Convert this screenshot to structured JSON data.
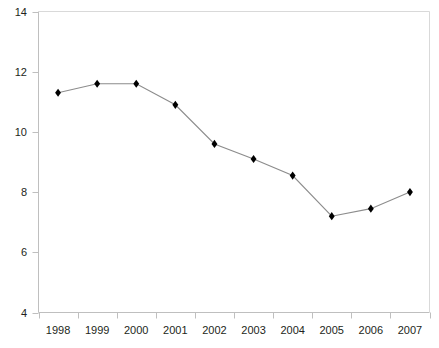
{
  "chart_data": {
    "type": "line",
    "title": "",
    "subtitle": "",
    "xlabel": "",
    "ylabel": "",
    "categories": [
      "1998",
      "1999",
      "2000",
      "2001",
      "2002",
      "2003",
      "2004",
      "2005",
      "2006",
      "2007"
    ],
    "x_tick_labels": [
      "1998",
      "1999",
      "2000",
      "2001",
      "2002",
      "2003",
      "2004",
      "2005",
      "2006",
      "2007"
    ],
    "y_tick_labels": [
      "14",
      "12",
      "10",
      "8",
      "6",
      "4"
    ],
    "y_ticks": [
      14,
      12,
      10,
      8,
      6,
      4
    ],
    "ylim": [
      4,
      14
    ],
    "grid": false,
    "legend": "none",
    "marker": "diamond",
    "series": [
      {
        "name": "",
        "values": [
          11.3,
          11.6,
          11.6,
          10.9,
          9.6,
          9.1,
          8.55,
          7.2,
          7.45,
          8.0
        ]
      }
    ],
    "colors": {
      "line": "#8c8c8c",
      "marker": "#000000",
      "axis": "#bfbfbf",
      "tick_label": "#231f20",
      "background": "#ffffff"
    }
  }
}
